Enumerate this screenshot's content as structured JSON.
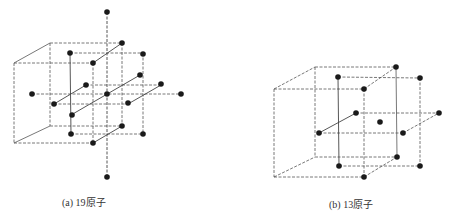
{
  "figures": [
    {
      "id": "a",
      "caption": "(a) 19原子",
      "atom_count": 19,
      "description": "Cube cluster with atoms at the center, face centers, and edge midpoints"
    },
    {
      "id": "b",
      "caption": "(b) 13原子",
      "atom_count": 13,
      "description": "Cube cluster with atoms at the center and edge midpoints"
    }
  ],
  "colors": {
    "atom": "#1a1a1a",
    "line": "#555555",
    "background": "#ffffff"
  }
}
